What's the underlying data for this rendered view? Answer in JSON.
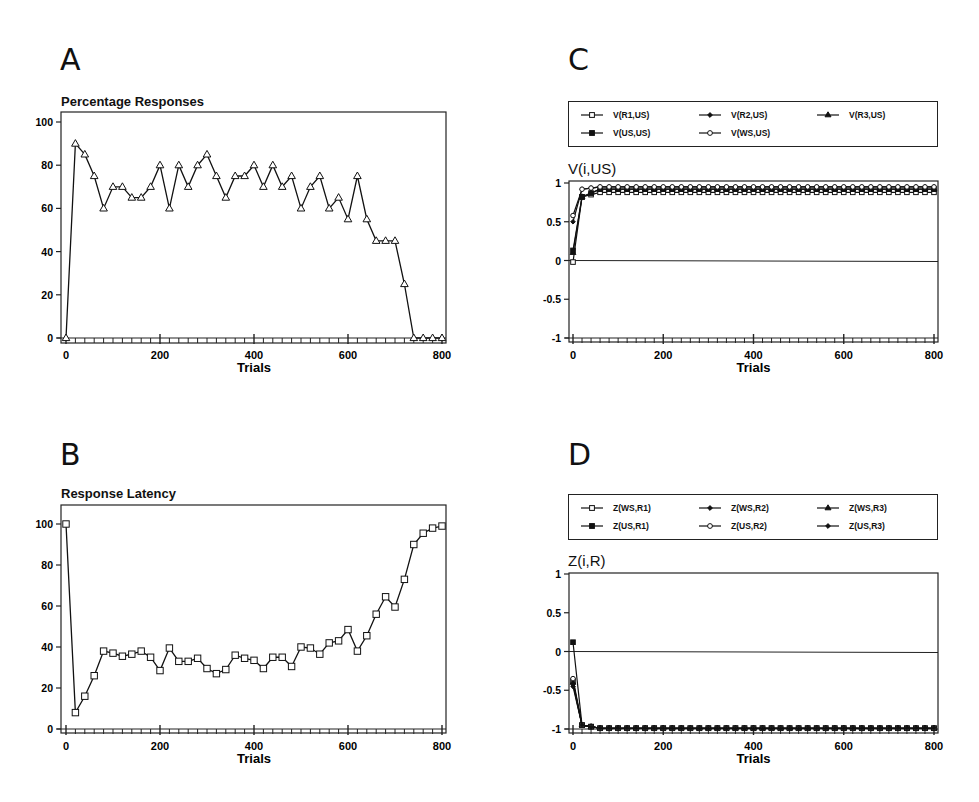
{
  "panels": {
    "A": {
      "letter": "A",
      "subtitle": "Percentage Responses"
    },
    "B": {
      "letter": "B",
      "subtitle": "Response Latency"
    },
    "C": {
      "letter": "C",
      "subtitle": "V(i,US)"
    },
    "D": {
      "letter": "D",
      "subtitle": "Z(i,R)"
    }
  },
  "chart_data": [
    {
      "id": "A",
      "type": "line",
      "title": "Percentage Responses",
      "xlabel": "Trials",
      "ylabel": "",
      "xlim": [
        0,
        800
      ],
      "ylim": [
        0,
        100
      ],
      "xticks": [
        0,
        200,
        400,
        600,
        800
      ],
      "yticks": [
        0,
        20,
        40,
        60,
        80,
        100
      ],
      "grid": false,
      "marker": "triangle-open",
      "x": [
        0,
        20,
        40,
        60,
        80,
        100,
        120,
        140,
        160,
        180,
        200,
        220,
        240,
        260,
        280,
        300,
        320,
        340,
        360,
        380,
        400,
        420,
        440,
        460,
        480,
        500,
        520,
        540,
        560,
        580,
        600,
        620,
        640,
        660,
        680,
        700,
        720,
        740,
        760,
        780,
        800
      ],
      "series": [
        {
          "name": "Percentage Responses",
          "values": [
            0,
            90,
            85,
            75,
            60,
            70,
            70,
            65,
            65,
            70,
            80,
            60,
            80,
            70,
            80,
            85,
            75,
            65,
            75,
            75,
            80,
            70,
            80,
            70,
            75,
            60,
            70,
            75,
            60,
            65,
            55,
            75,
            55,
            45,
            45,
            45,
            25,
            0,
            0,
            0,
            0
          ]
        }
      ]
    },
    {
      "id": "B",
      "type": "line",
      "title": "Response Latency",
      "xlabel": "Trials",
      "ylabel": "",
      "xlim": [
        0,
        800
      ],
      "ylim": [
        0,
        100
      ],
      "xticks": [
        0,
        200,
        400,
        600,
        800
      ],
      "yticks": [
        0,
        20,
        40,
        60,
        80,
        100
      ],
      "grid": false,
      "marker": "square-open",
      "x": [
        0,
        20,
        40,
        60,
        80,
        100,
        120,
        140,
        160,
        180,
        200,
        220,
        240,
        260,
        280,
        300,
        320,
        340,
        360,
        380,
        400,
        420,
        440,
        460,
        480,
        500,
        520,
        540,
        560,
        580,
        600,
        620,
        640,
        660,
        680,
        700,
        720,
        740,
        760,
        780,
        800
      ],
      "series": [
        {
          "name": "Response Latency",
          "values": [
            100,
            8,
            16,
            26,
            38,
            37,
            35.5,
            36.5,
            38,
            35,
            28.5,
            39.5,
            33,
            33,
            34.5,
            29.5,
            27,
            29,
            36,
            34.5,
            33.5,
            29.5,
            35,
            35,
            30.5,
            40,
            39.5,
            36.5,
            42,
            43,
            48.5,
            38,
            45.5,
            56,
            64.5,
            59.5,
            73,
            90,
            95.5,
            98,
            99
          ]
        }
      ]
    },
    {
      "id": "C",
      "type": "line",
      "title": "V(i,US)",
      "xlabel": "Trials",
      "ylabel": "",
      "xlim": [
        0,
        800
      ],
      "ylim": [
        -1,
        1
      ],
      "xticks": [
        0,
        200,
        400,
        600,
        800
      ],
      "yticks": [
        -1,
        -0.5,
        0,
        0.5,
        1
      ],
      "ytick_labels": [
        "-1",
        "-0.5",
        "0",
        "0.5",
        "1"
      ],
      "grid": false,
      "zero_line": true,
      "legend_position": "top",
      "series": [
        {
          "name": "V(R1,US)",
          "marker": "square-open",
          "start": -0.02,
          "t20": 0.82,
          "plateau": 0.88
        },
        {
          "name": "V(R2,US)",
          "marker": "diamond-filled",
          "start": 0.5,
          "t20": 0.92,
          "plateau": 0.95
        },
        {
          "name": "V(R3,US)",
          "marker": "triangle-filled",
          "start": 0.1,
          "t20": 0.82,
          "plateau": 0.92
        },
        {
          "name": "V(US,US)",
          "marker": "square-filled",
          "start": 0.13,
          "t20": 0.82,
          "plateau": 0.92
        },
        {
          "name": "V(WS,US)",
          "marker": "circle-open",
          "start": 0.58,
          "t20": 0.92,
          "plateau": 0.95
        }
      ]
    },
    {
      "id": "D",
      "type": "line",
      "title": "Z(i,R)",
      "xlabel": "Trials",
      "ylabel": "",
      "xlim": [
        0,
        800
      ],
      "ylim": [
        -1,
        1
      ],
      "xticks": [
        0,
        200,
        400,
        600,
        800
      ],
      "yticks": [
        -1,
        -0.5,
        0,
        0.5,
        1
      ],
      "ytick_labels": [
        "-1",
        "-0.5",
        "0",
        "0.5",
        "1"
      ],
      "grid": false,
      "zero_line": true,
      "legend_position": "top",
      "series": [
        {
          "name": "Z(WS,R1)",
          "marker": "square-open",
          "start": -0.38,
          "t20": -0.95,
          "plateau": -0.99
        },
        {
          "name": "Z(WS,R2)",
          "marker": "diamond-filled",
          "start": -0.42,
          "t20": -0.95,
          "plateau": -0.99
        },
        {
          "name": "Z(WS,R3)",
          "marker": "triangle-filled",
          "start": -0.4,
          "t20": -0.95,
          "plateau": -0.99
        },
        {
          "name": "Z(US,R1)",
          "marker": "square-filled",
          "start": 0.12,
          "t20": -0.95,
          "plateau": -0.99
        },
        {
          "name": "Z(US,R2)",
          "marker": "circle-open",
          "start": -0.35,
          "t20": -0.95,
          "plateau": -0.99
        },
        {
          "name": "Z(US,R3)",
          "marker": "diamond-filled",
          "start": -0.45,
          "t20": -0.95,
          "plateau": -0.99
        }
      ]
    }
  ],
  "layout": {
    "A": {
      "left": 61,
      "top": 112,
      "right": 446,
      "bottom": 343,
      "x0": 66,
      "x800": 442,
      "y_min_px": 338,
      "y_max_px": 122
    },
    "B": {
      "left": 61,
      "top": 505,
      "right": 446,
      "bottom": 733,
      "x0": 66,
      "x800": 442,
      "y_min_px": 729,
      "y_max_px": 524
    },
    "C": {
      "left": 569,
      "top": 181,
      "right": 938,
      "bottom": 342,
      "x0": 573,
      "x800": 934,
      "y_min_px": 338,
      "y_max_px": 183
    },
    "D": {
      "left": 569,
      "top": 573,
      "right": 938,
      "bottom": 733,
      "x0": 573,
      "x800": 934,
      "y_min_px": 729,
      "y_max_px": 574
    }
  }
}
